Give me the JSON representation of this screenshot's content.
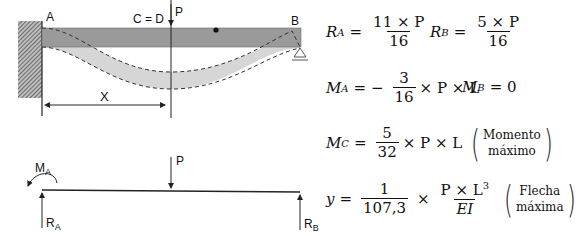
{
  "diagram": {
    "type": "propped cantilever beam with central point load",
    "top_labels": {
      "A": "A",
      "B": "B",
      "C_eq_D": "C = D",
      "P": "P",
      "X": "X"
    },
    "bottom_labels": {
      "P": "P",
      "MA_main": "M",
      "MA_sub": "A",
      "RA_main": "R",
      "RA_sub": "A",
      "RB_main": "R",
      "RB_sub": "B"
    },
    "colors": {
      "beam": "#9a9a9a",
      "deflection_band": "#d6d6d6",
      "wall_hatch": "#555555",
      "lines": "#222222"
    }
  },
  "formulas": {
    "RA": {
      "lhs": "R",
      "sub": "A",
      "eq": "=",
      "num": "11 × P",
      "den": "16"
    },
    "RB": {
      "lhs": "R",
      "sub": "B",
      "eq": "=",
      "num": "5 × P",
      "den": "16"
    },
    "MA": {
      "lhs": "M",
      "sub": "A",
      "eq": "= −",
      "num": "3",
      "den": "16",
      "rest": "× P × L"
    },
    "MB": {
      "lhs": "M",
      "sub": "B",
      "rest": "= 0"
    },
    "MC": {
      "lhs": "M",
      "sub": "C",
      "eq": "=",
      "num": "5",
      "den": "32",
      "rest": "× P × L",
      "note_line1": "Momento",
      "note_line2": "máximo"
    },
    "y": {
      "lhs": "y",
      "eq": "=",
      "num": "1",
      "den": "107,3",
      "times": "×",
      "num2": "P × L",
      "num2_sup": "3",
      "den2": "EI",
      "note_line1": "Flecha",
      "note_line2": "máxima"
    }
  }
}
